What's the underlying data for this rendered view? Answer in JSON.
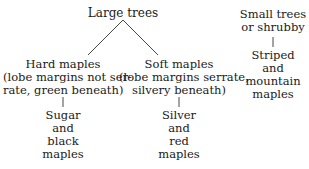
{
  "diagram": {
    "root": {
      "label": "Large trees"
    },
    "hard": {
      "title": "Hard maples",
      "line1": "(lobe margins not ser-",
      "line2": "rate, green beneath)"
    },
    "soft": {
      "title": "Soft maples",
      "line1": "(lobe margins serrate,",
      "line2": "silvery beneath)"
    },
    "hard_leaf": {
      "l1": "Sugar",
      "l2": "and",
      "l3": "black",
      "l4": "maples"
    },
    "soft_leaf": {
      "l1": "Silver",
      "l2": "and",
      "l3": "red",
      "l4": "maples"
    },
    "small": {
      "l1": "Small trees",
      "l2": "or shrubby"
    },
    "small_leaf": {
      "l1": "Striped",
      "l2": "and",
      "l3": "mountain",
      "l4": "maples"
    }
  }
}
